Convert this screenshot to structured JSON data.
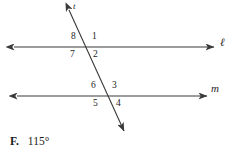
{
  "figure": {
    "type": "two-parallel-lines-cut-by-transversal",
    "stroke_color": "#3a3a3a",
    "background_color": "#ffffff",
    "lines": [
      {
        "name": "l",
        "label": "ℓ",
        "label_x": 220,
        "label_y": 41,
        "y": 47,
        "x_start": 14,
        "x_end": 214,
        "arrow_left": true,
        "arrow_right": true
      },
      {
        "name": "m",
        "label": "m",
        "label_x": 213,
        "label_y": 84,
        "y": 96,
        "x_start": 17,
        "x_end": 207,
        "arrow_left": true,
        "arrow_right": true
      },
      {
        "name": "t",
        "label": "t",
        "label_x": 74,
        "label_y": 4,
        "arrow_top": true,
        "arrow_bottom": true
      }
    ],
    "transversal": {
      "x1": 69,
      "y1": 10,
      "x2": 124,
      "y2": 131
    },
    "intersections": [
      {
        "line": "l",
        "x": 88,
        "y": 47
      },
      {
        "line": "m",
        "x": 110,
        "y": 96
      }
    ],
    "angle_labels": [
      {
        "text": "8",
        "x": 73,
        "y": 36,
        "position": "upper-left-of-l-intersection"
      },
      {
        "text": "1",
        "x": 93,
        "y": 36,
        "position": "upper-right-of-l-intersection"
      },
      {
        "text": "7",
        "x": 72,
        "y": 51,
        "position": "lower-left-of-l-intersection"
      },
      {
        "text": "2",
        "x": 94,
        "y": 51,
        "position": "lower-right-of-l-intersection"
      },
      {
        "text": "6",
        "x": 93,
        "y": 85,
        "position": "upper-left-of-m-intersection"
      },
      {
        "text": "3",
        "x": 113,
        "y": 85,
        "position": "upper-right-of-m-intersection"
      },
      {
        "text": "5",
        "x": 95,
        "y": 100,
        "position": "lower-left-of-m-intersection"
      },
      {
        "text": "4",
        "x": 117,
        "y": 100,
        "position": "lower-right-of-m-intersection"
      }
    ]
  },
  "answer_choice": {
    "letter": "F.",
    "value": "115°"
  }
}
